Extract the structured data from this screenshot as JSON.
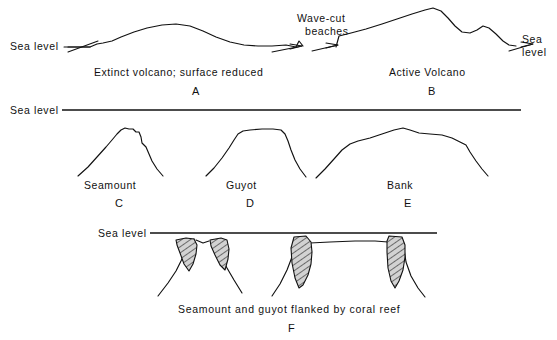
{
  "figure": {
    "background_color": "#ffffff",
    "ink_color": "#111111"
  },
  "panels": [
    {
      "id": "A",
      "letter": "A",
      "caption": "Extinct volcano; surface reduced",
      "sea_level_label": "Sea level",
      "row": "top"
    },
    {
      "id": "B",
      "letter": "B",
      "caption": "Active Volcano",
      "sea_level_label_line1": "Sea",
      "sea_level_label_line2": "level",
      "annotation_line1": "Wave-cut",
      "annotation_line2": "beaches",
      "row": "top"
    },
    {
      "id": "C",
      "letter": "C",
      "caption": "Seamount",
      "row": "middle"
    },
    {
      "id": "D",
      "letter": "D",
      "caption": "Guyot",
      "row": "middle"
    },
    {
      "id": "E",
      "letter": "E",
      "caption": "Bank",
      "row": "middle"
    },
    {
      "id": "F",
      "letter": "F",
      "caption": "Seamount and guyot flanked by coral reef",
      "row": "bottom"
    }
  ],
  "labels": {
    "sea_level_top_left": "Sea level",
    "sea_level_top_right_line1": "Sea",
    "sea_level_top_right_line2": "level",
    "sea_level_middle": "Sea level",
    "sea_level_bottom": "Sea level",
    "wave_cut_line1": "Wave-cut",
    "wave_cut_line2": "beaches",
    "caption_a": "Extinct volcano; surface reduced",
    "caption_b": "Active Volcano",
    "caption_c": "Seamount",
    "caption_d": "Guyot",
    "caption_e": "Bank",
    "caption_f": "Seamount and guyot flanked by coral reef",
    "letter_a": "A",
    "letter_b": "B",
    "letter_c": "C",
    "letter_d": "D",
    "letter_e": "E",
    "letter_f": "F"
  },
  "geometry": {
    "sea_level_line_middle": {
      "x1": 62,
      "x2": 521,
      "y": 110
    },
    "sea_level_line_bottom": {
      "x1": 150,
      "x2": 437,
      "y": 233
    },
    "profile_a_path": "M 68,47 L 90,47 L 97,44 L 103,43 L 112,41 L 121,37 L 134,32 L 147,28 L 162,25 L 176,24 L 190,26 L 203,31 L 216,37 L 230,42 L 244,45 L 258,46 L 272,46 L 286,45 L 296,47",
    "profile_b_path": "M 336,47 L 339,36 L 351,33 L 366,29 L 382,24 L 397,19 L 412,14 L 425,10 L 433,8 L 441,11 L 448,18 L 455,26 L 462,32 L 470,33 L 477,30 L 483,26 L 489,28 L 496,34 L 503,41 L 509,45 L 516,46",
    "profile_c_path": "M 78,176 L 88,167 L 97,157 L 106,147 L 112,140 L 117,134 L 121,130 L 125,128 L 129,129 L 133,129 L 136,132 L 139,132 L 141,137 L 142,143 L 146,147 L 149,154 L 152,161 L 157,169 L 163,176",
    "profile_d_path": "M 206,176 L 214,168 L 222,158 L 229,148 L 234,140 L 238,134 L 243,131 L 250,130 L 262,129 L 273,129 L 281,130 L 285,134 L 288,141 L 291,150 L 295,160 L 300,169 L 306,177",
    "profile_e_path": "M 316,178 L 325,169 L 334,159 L 342,150 L 350,144 L 358,141 L 370,138 L 382,134 L 394,130 L 403,128 L 410,130 L 419,133 L 430,134 L 442,135 L 452,138 L 460,142 L 466,145 L 470,152 L 476,161 L 482,169 L 488,176",
    "reef_seamount_flank_left": "M 176,240 L 186,238 L 193,247 L 196,256 L 194,266 L 189,270 L 182,262 L 178,252 Z",
    "reef_seamount_flank_right": "M 212,239 L 222,238 L 226,248 L 228,258 L 225,270 L 219,266 L 213,256 L 209,247 Z",
    "reef_guyot_flank_left": "M 293,237 L 306,236 L 310,246 L 311,258 L 309,272 L 304,283 L 299,288 L 294,278 L 291,262 L 290,248 Z",
    "reef_guyot_flank_right": "M 390,236 L 403,237 L 405,249 L 404,264 L 401,278 L 396,288 L 391,283 L 387,270 L 386,254 L 387,243 Z"
  },
  "colors": {
    "ink": "#111111",
    "reef_fill": "#b9b9b9",
    "paper": "#ffffff"
  }
}
